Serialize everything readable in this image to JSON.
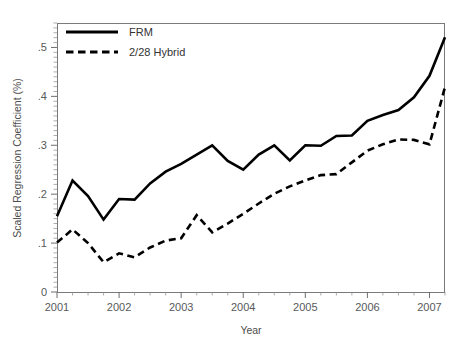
{
  "figure": {
    "background": "#ffffff",
    "line_color": "#000000",
    "axis_color": "#7a7a7a"
  },
  "chart_data": {
    "type": "line",
    "title": "",
    "xlabel": "Year",
    "ylabel": "Scaled Regression Coefficient (%)",
    "xlim": [
      2001.0,
      2007.25
    ],
    "ylim": [
      0,
      0.55
    ],
    "grid": false,
    "legend_position": "top-left",
    "xticks": [
      2001,
      2002,
      2003,
      2004,
      2005,
      2006,
      2007
    ],
    "xtick_labels": [
      "2001",
      "2002",
      "2003",
      "2004",
      "2005",
      "2006",
      "2007"
    ],
    "x_minor_tick_interval": 0.25,
    "yticks": [
      0,
      0.1,
      0.2,
      0.3,
      0.4,
      0.5
    ],
    "ytick_labels": [
      "0",
      ".1",
      ".2",
      ".3",
      ".4",
      ".5"
    ],
    "y_minor_tick_interval": 0.01,
    "x": [
      2001.0,
      2001.25,
      2001.5,
      2001.75,
      2002.0,
      2002.25,
      2002.5,
      2002.75,
      2003.0,
      2003.25,
      2003.5,
      2003.75,
      2004.0,
      2004.25,
      2004.5,
      2004.75,
      2005.0,
      2005.25,
      2005.5,
      2005.75,
      2006.0,
      2006.25,
      2006.5,
      2006.75,
      2007.0,
      2007.25
    ],
    "series": [
      {
        "name": "FRM",
        "style": "solid",
        "color": "#000000",
        "values": [
          0.155,
          0.228,
          0.196,
          0.148,
          0.19,
          0.189,
          0.222,
          0.246,
          0.262,
          0.281,
          0.3,
          0.268,
          0.25,
          0.281,
          0.3,
          0.269,
          0.3,
          0.299,
          0.319,
          0.32,
          0.35,
          0.362,
          0.372,
          0.398,
          0.442,
          0.521
        ]
      },
      {
        "name": "2/28 Hybrid",
        "style": "dashed",
        "color": "#000000",
        "values": [
          0.101,
          0.128,
          0.1,
          0.061,
          0.079,
          0.071,
          0.091,
          0.105,
          0.11,
          0.157,
          0.122,
          0.14,
          0.16,
          0.181,
          0.201,
          0.216,
          0.228,
          0.239,
          0.241,
          0.265,
          0.289,
          0.302,
          0.312,
          0.311,
          0.302,
          0.419
        ]
      }
    ],
    "legend_entries": [
      "FRM",
      "2/28 Hybrid"
    ]
  },
  "plot_geometry": {
    "left": 57,
    "right": 445,
    "top": 23,
    "bottom": 292
  },
  "legend": {
    "items": [
      {
        "label": "FRM",
        "style": "solid"
      },
      {
        "label": "2/28 Hybrid",
        "style": "dashed"
      }
    ]
  },
  "axes": {
    "x_title": "Year",
    "y_title": "Scaled Regression Coefficient (%)"
  }
}
